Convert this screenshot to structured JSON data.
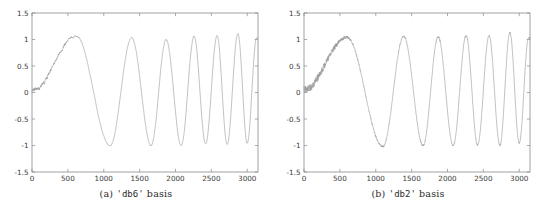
{
  "figure": {
    "background_color": "#ffffff",
    "axis_color": "#8a8a8a",
    "line_color": "#9a9a9a",
    "text_color": "#2b2b2b"
  },
  "panels": [
    {
      "id": "panel-a",
      "caption_prefix": "(a)",
      "caption_basis": "'db6'",
      "caption_suffix": "basis",
      "caption_full": "(a) 'db6' basis"
    },
    {
      "id": "panel-b",
      "caption_prefix": "(b)",
      "caption_basis": "'db2'",
      "caption_suffix": "basis",
      "caption_full": "(b) 'db2' basis"
    }
  ],
  "chart_data": [
    {
      "type": "line",
      "title": "(a) 'db6' basis",
      "xlabel": "",
      "ylabel": "",
      "xlim": [
        0,
        3150
      ],
      "ylim": [
        -1.5,
        1.5
      ],
      "grid": false,
      "legend": "none",
      "xticks": [
        0,
        500,
        1000,
        1500,
        2000,
        2500,
        3000
      ],
      "xticklabels": [
        "0",
        "500",
        "1000",
        "1500",
        "2000",
        "2500",
        "3000"
      ],
      "yticks": [
        -1.5,
        -1,
        -0.5,
        0,
        0.5,
        1,
        1.5
      ],
      "yticklabels": [
        "-1.5",
        "-1",
        "-0.5",
        "0",
        "0.5",
        "1",
        "1.5"
      ],
      "series": [
        {
          "name": "db6 denoised chirp",
          "description": "Noisy swept-frequency (chirp) signal denoised with a 'db6' wavelet basis; smooth residual ripple, amplitude near 1",
          "noise_amplitude": 0.05,
          "noise_smoothness": "smooth",
          "peaks_x": [
            620,
            1390,
            1870,
            2260,
            2580,
            2870,
            3130
          ],
          "peaks_y": [
            1.06,
            1.04,
            1.0,
            1.06,
            1.07,
            1.11,
            1.02
          ],
          "troughs_x": [
            1090,
            1660,
            2080,
            2420,
            2720,
            3000
          ],
          "troughs_y": [
            -1.0,
            -1.0,
            -1.0,
            -0.97,
            -0.97,
            -0.96
          ],
          "start_value": 0.02
        }
      ]
    },
    {
      "type": "line",
      "title": "(b) 'db2' basis",
      "xlabel": "",
      "ylabel": "",
      "xlim": [
        0,
        3150
      ],
      "ylim": [
        -1.5,
        1.5
      ],
      "grid": false,
      "legend": "none",
      "xticks": [
        0,
        500,
        1000,
        1500,
        2000,
        2500,
        3000
      ],
      "xticklabels": [
        "0",
        "500",
        "1000",
        "1500",
        "2000",
        "2500",
        "3000"
      ],
      "yticks": [
        -1.5,
        -1,
        -0.5,
        0,
        0.5,
        1,
        1.5
      ],
      "yticklabels": [
        "-1.5",
        "-1",
        "-0.5",
        "0",
        "0.5",
        "1",
        "1.5"
      ],
      "series": [
        {
          "name": "db2 denoised chirp",
          "description": "Same chirp denoised with a 'db2' wavelet basis; residual noise is more angular/jagged than db6",
          "noise_amplitude": 0.055,
          "noise_smoothness": "jagged",
          "peaks_x": [
            600,
            1390,
            1870,
            2260,
            2580,
            2870,
            3130
          ],
          "peaks_y": [
            1.04,
            1.06,
            1.05,
            1.07,
            1.07,
            1.13,
            1.03
          ],
          "troughs_x": [
            1100,
            1660,
            2080,
            2420,
            2730,
            3000
          ],
          "troughs_y": [
            -1.02,
            -1.0,
            -1.0,
            -0.99,
            -1.0,
            -0.95
          ],
          "start_value": 0.05
        }
      ]
    }
  ]
}
